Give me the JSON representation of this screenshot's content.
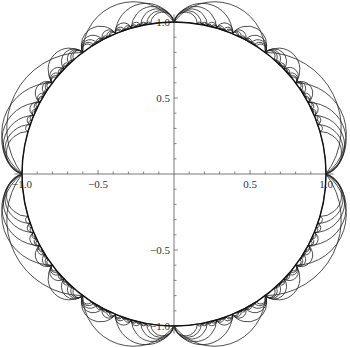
{
  "figure": {
    "title": "",
    "type": "hyperbolic-tessellation",
    "disk": {
      "center_px": [
        174,
        174
      ],
      "radius_px": 152,
      "boundary_color": "#111111"
    },
    "line_color": "#222222",
    "axis_color": "#555555",
    "x_axis": {
      "range": [
        -1.05,
        1.05
      ],
      "major_ticks": [
        {
          "value": -1.0,
          "label": "-1.0"
        },
        {
          "value": -0.5,
          "label": "-0.5"
        },
        {
          "value": 0.5,
          "label": "0.5"
        },
        {
          "value": 1.0,
          "label": "1.0"
        }
      ],
      "minor_step": 0.1
    },
    "y_axis": {
      "range": [
        -1.05,
        1.05
      ],
      "major_ticks": [
        {
          "value": 1.0,
          "label": "1.0"
        },
        {
          "value": 0.5,
          "label": "0.5"
        },
        {
          "value": -0.5,
          "label": "-0.5"
        },
        {
          "value": -1.0,
          "label": "-1.0"
        }
      ],
      "minor_step": 0.1
    },
    "ideal_vertices_deg": [
      0,
      90,
      180,
      270
    ],
    "recursion_depth": 6
  }
}
